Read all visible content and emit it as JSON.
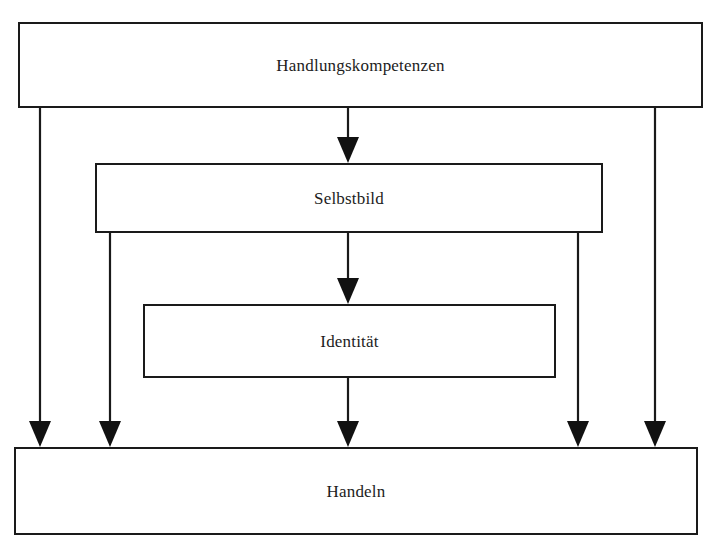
{
  "diagram": {
    "title_text": "",
    "background_color": "#ffffff",
    "line_color": "#1a1a1a",
    "text_color": "#1c1c1c",
    "nodes": [
      {
        "id": "handlungskompetenzen",
        "label": "Handlungskompetenzen",
        "x": 18,
        "y": 22,
        "width": 685,
        "height": 86
      },
      {
        "id": "selbstbild",
        "label": "Selbstbild",
        "x": 95,
        "y": 163,
        "width": 508,
        "height": 70
      },
      {
        "id": "identitaet",
        "label": "Identität",
        "x": 143,
        "y": 304,
        "width": 413,
        "height": 74
      },
      {
        "id": "handeln",
        "label": "Handeln",
        "x": 14,
        "y": 447,
        "width": 684,
        "height": 88
      }
    ],
    "edges": [
      {
        "id": "edge-handlungskompetenzen-to-selbstbild",
        "from": "handlungskompetenzen",
        "to": "selbstbild",
        "x": 348,
        "y1": 108,
        "y2": 163,
        "arrowhead": "down"
      },
      {
        "id": "edge-selbstbild-to-identitaet",
        "from": "selbstbild",
        "to": "identitaet",
        "x": 348,
        "y1": 233,
        "y2": 304,
        "arrowhead": "down"
      },
      {
        "id": "edge-handlungskompetenzen-to-handeln-left",
        "from": "handlungskompetenzen",
        "to": "handeln",
        "x": 40,
        "y1": 108,
        "y2": 447,
        "arrowhead": "down"
      },
      {
        "id": "edge-selbstbild-to-handeln-left",
        "from": "selbstbild",
        "to": "handeln",
        "x": 110,
        "y1": 233,
        "y2": 447,
        "arrowhead": "down"
      },
      {
        "id": "edge-identitaet-to-handeln",
        "from": "identitaet",
        "to": "handeln",
        "x": 348,
        "y1": 378,
        "y2": 447,
        "arrowhead": "down"
      },
      {
        "id": "edge-selbstbild-to-handeln-right",
        "from": "selbstbild",
        "to": "handeln",
        "x": 578,
        "y1": 233,
        "y2": 447,
        "arrowhead": "down"
      },
      {
        "id": "edge-handlungskompetenzen-to-handeln-right",
        "from": "handlungskompetenzen",
        "to": "handeln",
        "x": 655,
        "y1": 108,
        "y2": 447,
        "arrowhead": "down"
      }
    ]
  }
}
